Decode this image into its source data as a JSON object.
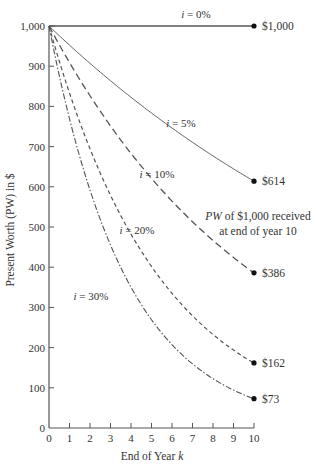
{
  "chart_data": {
    "type": "line",
    "title": "",
    "xlabel": "End of Year k",
    "ylabel": "Present Worth (PW) in $",
    "xlim": [
      0,
      10
    ],
    "ylim": [
      0,
      1000
    ],
    "x_ticks": [
      "0",
      "1",
      "2",
      "3",
      "4",
      "5",
      "6",
      "7",
      "8",
      "9",
      "10"
    ],
    "y_ticks": [
      "0",
      "100",
      "200",
      "300",
      "400",
      "500",
      "600",
      "700",
      "800",
      "900",
      "1,000"
    ],
    "grid": false,
    "x": [
      0,
      1,
      2,
      3,
      4,
      5,
      6,
      7,
      8,
      9,
      10
    ],
    "series": [
      {
        "name": "i = 0%",
        "rate": 0.0,
        "style": "solid-thick",
        "values": [
          1000,
          1000,
          1000,
          1000,
          1000,
          1000,
          1000,
          1000,
          1000,
          1000,
          1000
        ],
        "end_label": "$1,000"
      },
      {
        "name": "i = 5%",
        "rate": 0.05,
        "style": "solid-thin",
        "values": [
          1000,
          952,
          907,
          864,
          823,
          784,
          746,
          711,
          677,
          645,
          614
        ],
        "end_label": "$614"
      },
      {
        "name": "i = 10%",
        "rate": 0.1,
        "style": "long-dash",
        "values": [
          1000,
          909,
          826,
          751,
          683,
          621,
          564,
          513,
          467,
          424,
          386
        ],
        "end_label": "$386"
      },
      {
        "name": "i = 20%",
        "rate": 0.2,
        "style": "short-dash",
        "values": [
          1000,
          833,
          694,
          579,
          482,
          402,
          335,
          279,
          233,
          194,
          162
        ],
        "end_label": "$162"
      },
      {
        "name": "i = 30%",
        "rate": 0.3,
        "style": "dash-dot",
        "values": [
          1000,
          769,
          592,
          455,
          350,
          269,
          207,
          159,
          123,
          94,
          73
        ],
        "end_label": "$73"
      }
    ],
    "annotations": [
      "PW of $1,000 received",
      "at end of year 10"
    ]
  },
  "labels": {
    "series": [
      {
        "pre": "i",
        "post": " = 0%"
      },
      {
        "pre": "i",
        "post": " = 5%"
      },
      {
        "pre": "i",
        "post": " = 10%"
      },
      {
        "pre": "i",
        "post": " = 20%"
      },
      {
        "pre": "i",
        "post": " = 30%"
      }
    ],
    "annotation_line1_italic": "PW",
    "annotation_line1_rest": " of $1,000 received",
    "annotation_line2": "at end of year 10",
    "xlabel_main": "End of Year ",
    "xlabel_var": "k"
  }
}
